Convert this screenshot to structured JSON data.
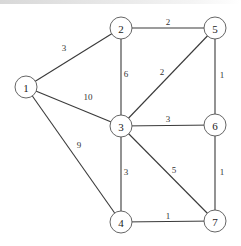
{
  "graph": {
    "title": "",
    "nodes": [
      {
        "id": "1",
        "label": "1",
        "x": 26,
        "y": 87
      },
      {
        "id": "2",
        "label": "2",
        "x": 121,
        "y": 28
      },
      {
        "id": "3",
        "label": "3",
        "x": 121,
        "y": 126
      },
      {
        "id": "4",
        "label": "4",
        "x": 121,
        "y": 222
      },
      {
        "id": "5",
        "label": "5",
        "x": 215,
        "y": 28
      },
      {
        "id": "6",
        "label": "6",
        "x": 215,
        "y": 125
      },
      {
        "id": "7",
        "label": "7",
        "x": 215,
        "y": 221
      }
    ],
    "edges": [
      {
        "from": "1",
        "to": "2",
        "weight": "3",
        "label_x": 64,
        "label_y": 48
      },
      {
        "from": "1",
        "to": "3",
        "weight": "10",
        "label_x": 88,
        "label_y": 97
      },
      {
        "from": "1",
        "to": "4",
        "weight": "9",
        "label_x": 79,
        "label_y": 145
      },
      {
        "from": "2",
        "to": "5",
        "weight": "2",
        "label_x": 168,
        "label_y": 22
      },
      {
        "from": "2",
        "to": "3",
        "weight": "6",
        "label_x": 126,
        "label_y": 74
      },
      {
        "from": "3",
        "to": "5",
        "weight": "2",
        "label_x": 162,
        "label_y": 72
      },
      {
        "from": "5",
        "to": "6",
        "weight": "1",
        "label_x": 222,
        "label_y": 75
      },
      {
        "from": "3",
        "to": "6",
        "weight": "3",
        "label_x": 168,
        "label_y": 119
      },
      {
        "from": "3",
        "to": "4",
        "weight": "3",
        "label_x": 126,
        "label_y": 172
      },
      {
        "from": "3",
        "to": "7",
        "weight": "5",
        "label_x": 174,
        "label_y": 170
      },
      {
        "from": "6",
        "to": "7",
        "weight": "1",
        "label_x": 222,
        "label_y": 172
      },
      {
        "from": "4",
        "to": "7",
        "weight": "1",
        "label_x": 168,
        "label_y": 216
      }
    ],
    "node_radius": 11,
    "colors": {
      "edge": "#3a3a3a",
      "node_stroke": "#555555",
      "node_fill": "#ffffff",
      "text": "#222222"
    }
  }
}
